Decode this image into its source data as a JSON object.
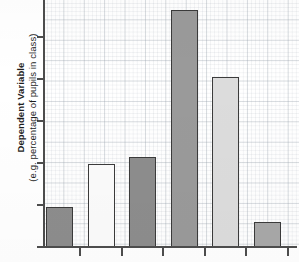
{
  "chart_data": {
    "type": "bar",
    "title": "",
    "subtitle": "",
    "xlabel": "",
    "ylabel": "Dependent Variable (e.g. percentage of pupils in class)",
    "ylabel_main": "Dependent Variable",
    "ylabel_sub": "(e.g. percentage of pupils in class)",
    "categories": [
      "1",
      "2",
      "3",
      "4",
      "5",
      "6"
    ],
    "values": [
      0.95,
      1.98,
      2.15,
      5.65,
      4.05,
      0.6
    ],
    "ylim": [
      0,
      5.9
    ],
    "xlim": [
      0,
      6
    ],
    "grid": true,
    "grid_style": "graph-paper",
    "legend": "none",
    "tick_labels_x": [
      "",
      "",
      "",
      "",
      "",
      ""
    ],
    "tick_labels_y": [
      "",
      "",
      "",
      "",
      "",
      ""
    ],
    "y_tick_count": 6,
    "x_tick_count": 6,
    "bar_fills": [
      "#8d8d8d",
      "#fbfbfb",
      "#8d8d8d",
      "#9a9a9a",
      "#dcdcdc",
      "#a8a8a8"
    ],
    "bar_edge_color": "#3b3b3b",
    "axis_color": "#4d4d4d",
    "background_color": "#ffffff"
  },
  "axis": {
    "y_title_main": "Dependent Variable",
    "y_title_sub": "(e.g. percentage of pupils in class)"
  }
}
